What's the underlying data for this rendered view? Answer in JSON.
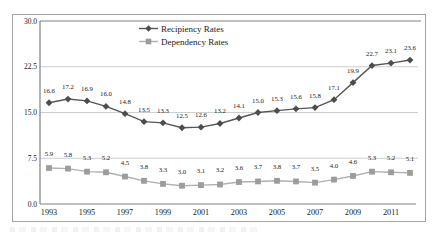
{
  "figure": {
    "border_color": "#a3a3a3",
    "background": "#ffffff",
    "text_color": "#1a1a1a",
    "axis_color": "#808080",
    "gridline_color": "#c8c8c8"
  },
  "chart_data": {
    "type": "line",
    "title": "",
    "xlabel": "",
    "ylabel": "",
    "x": [
      1993,
      1994,
      1995,
      1996,
      1997,
      1998,
      1999,
      2000,
      2001,
      2002,
      2003,
      2004,
      2005,
      2006,
      2007,
      2008,
      2009,
      2010,
      2011,
      2012
    ],
    "xtick_labels": [
      "1993",
      "1995",
      "1997",
      "1999",
      "2001",
      "2003",
      "2005",
      "2007",
      "2009",
      "2011"
    ],
    "ylim": [
      0,
      30
    ],
    "yticks": [
      0,
      7.5,
      15,
      22.5,
      30
    ],
    "ytick_labels": [
      "0.0",
      "7.5",
      "15.0",
      "22.5",
      "30.0"
    ],
    "grid": "horizontal",
    "legend_position": "top-center",
    "data_labels": true,
    "series": [
      {
        "name": "Recipiency Rates",
        "marker": "diamond",
        "color": "#575757",
        "marker_color": "#4d4d4d",
        "values": [
          16.6,
          17.2,
          16.9,
          16.0,
          14.8,
          13.5,
          13.3,
          12.5,
          12.6,
          13.2,
          14.1,
          15.0,
          15.3,
          15.6,
          15.8,
          17.1,
          19.9,
          22.7,
          23.1,
          23.6
        ]
      },
      {
        "name": "Dependency Rates",
        "marker": "square",
        "color": "#b0b0b0",
        "marker_color": "#9c9c9c",
        "values": [
          5.9,
          5.8,
          5.3,
          5.2,
          4.5,
          3.8,
          3.3,
          3.0,
          3.1,
          3.2,
          3.6,
          3.7,
          3.8,
          3.7,
          3.5,
          4.0,
          4.6,
          5.3,
          5.2,
          5.1
        ]
      }
    ]
  }
}
